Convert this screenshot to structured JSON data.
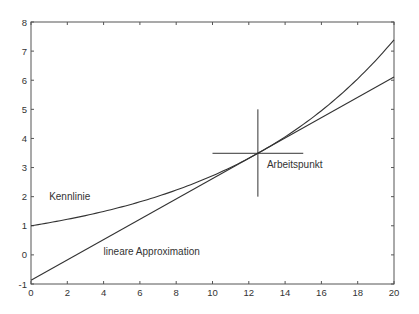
{
  "chart_data": {
    "type": "line",
    "title": "",
    "xlabel": "",
    "ylabel": "",
    "xlim": [
      0,
      20
    ],
    "ylim": [
      -1,
      8
    ],
    "grid": false,
    "x_ticks": [
      "0",
      "2",
      "4",
      "6",
      "8",
      "10",
      "12",
      "14",
      "16",
      "18",
      "20"
    ],
    "y_ticks": [
      "-1",
      "0",
      "1",
      "2",
      "3",
      "4",
      "5",
      "6",
      "7",
      "8"
    ],
    "series": [
      {
        "name": "Kennlinie",
        "description": "nonlinear characteristic curve, approx. y = e^(0.1x)",
        "x": [
          0,
          2,
          4,
          6,
          8,
          10,
          12,
          12.5,
          14,
          16,
          18,
          20
        ],
        "values": [
          1.0,
          1.22,
          1.49,
          1.82,
          2.23,
          2.72,
          3.32,
          3.49,
          4.06,
          4.95,
          6.05,
          7.39
        ]
      },
      {
        "name": "lineare Approximation",
        "description": "tangent line at operating point",
        "x": [
          0,
          20
        ],
        "values": [
          -0.87,
          6.11
        ]
      }
    ],
    "operating_point": {
      "x": 12.5,
      "y": 3.49,
      "cross_x_range": [
        10,
        15
      ],
      "cross_y_range": [
        2,
        5
      ]
    },
    "annotations": [
      {
        "text": "Kennlinie",
        "x": 1,
        "y": 1.9
      },
      {
        "text": "lineare Approximation",
        "x": 4,
        "y": 0.0
      },
      {
        "text": "Arbeitspunkt",
        "x": 13,
        "y": 3.0
      }
    ]
  },
  "labels": {
    "kennlinie": "Kennlinie",
    "approx": "lineare Approximation",
    "arbeitspunkt": "Arbeitspunkt"
  },
  "colors": {
    "line": "#333333",
    "axis": "#555555",
    "background": "#ffffff"
  }
}
